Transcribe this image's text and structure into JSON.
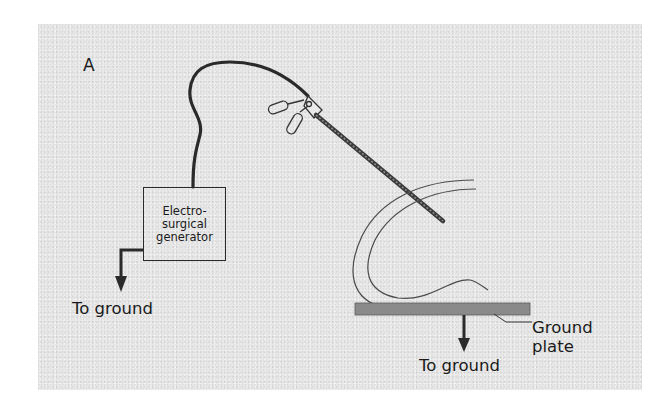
{
  "figure": {
    "panel_label": "A",
    "generator": {
      "lines": [
        "Electro-",
        "surgical",
        "generator"
      ]
    },
    "labels": {
      "ground_left": "To ground",
      "ground_right": "To ground",
      "ground_plate_line1": "Ground",
      "ground_plate_line2": "plate"
    },
    "components": [
      "electrosurgical-generator",
      "cable",
      "laparoscopic-instrument",
      "patient-body-outline",
      "ground-plate",
      "ground-arrows"
    ],
    "colors": {
      "background": "#e9e9e9",
      "line": "#2a2a2a",
      "plate": "#8a8a8a"
    }
  }
}
